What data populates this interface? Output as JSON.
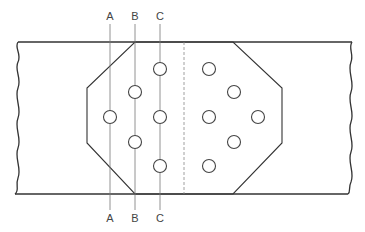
{
  "diagram": {
    "type": "bolted splice plate with section lines",
    "sections": [
      {
        "id": "A",
        "top_label": "A",
        "bottom_label": "A",
        "x": 110
      },
      {
        "id": "B",
        "top_label": "B",
        "bottom_label": "B",
        "x": 135
      },
      {
        "id": "C",
        "top_label": "C",
        "bottom_label": "C",
        "x": 160
      }
    ],
    "holes": {
      "left_group": [
        {
          "x": 160,
          "y": 69
        },
        {
          "x": 135,
          "y": 92
        },
        {
          "x": 110,
          "y": 117
        },
        {
          "x": 160,
          "y": 117
        },
        {
          "x": 135,
          "y": 142
        },
        {
          "x": 160,
          "y": 166
        }
      ],
      "right_group": [
        {
          "x": 209,
          "y": 69
        },
        {
          "x": 234,
          "y": 92
        },
        {
          "x": 209,
          "y": 117
        },
        {
          "x": 258,
          "y": 117
        },
        {
          "x": 234,
          "y": 142
        },
        {
          "x": 209,
          "y": 166
        }
      ]
    },
    "colors": {
      "line": "#333333",
      "section_line": "#777777",
      "background": "#ffffff"
    }
  }
}
